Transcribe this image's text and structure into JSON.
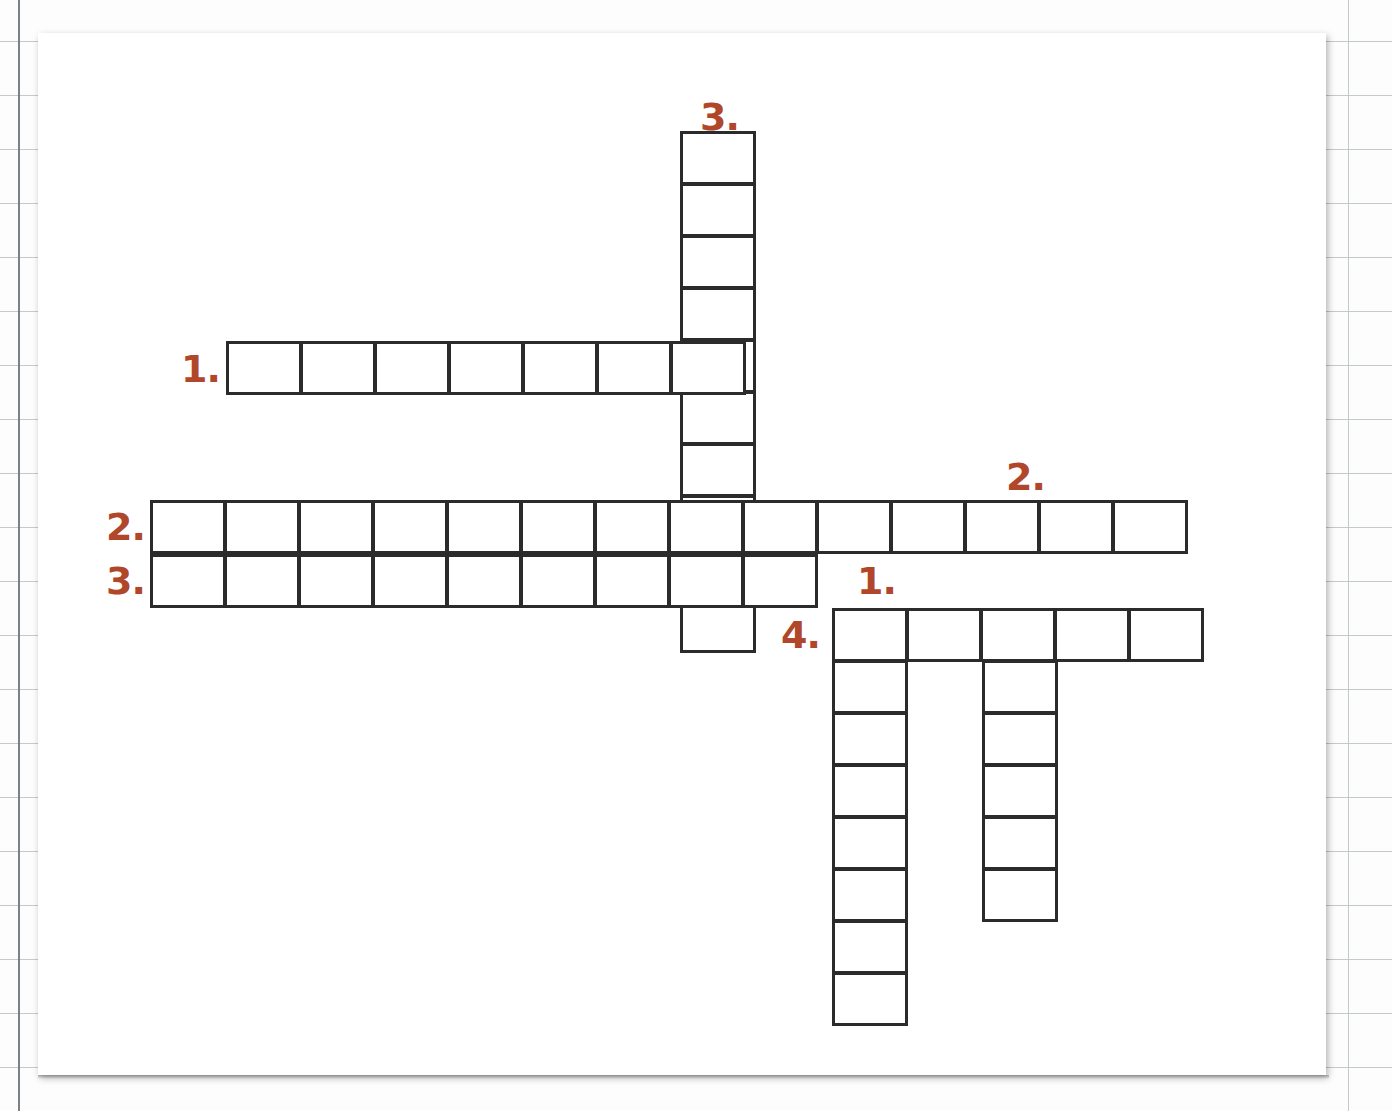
{
  "worksheet": {
    "type": "crossword-puzzle",
    "background": "ruled-graph-paper",
    "sheet_color": "#ffffff",
    "grid_line_color": "#2b2b2b",
    "clue_number_color": "#b0462a",
    "cell_width": 76,
    "cell_height": 54
  },
  "clue_numbers": [
    {
      "id": "down-3",
      "label": "3.",
      "x": 700,
      "y": 98
    },
    {
      "id": "across-1",
      "label": "1.",
      "x": 181,
      "y": 350
    },
    {
      "id": "down-2",
      "label": "2.",
      "x": 1006,
      "y": 458
    },
    {
      "id": "across-2",
      "label": "2.",
      "x": 106,
      "y": 508
    },
    {
      "id": "across-3",
      "label": "3.",
      "x": 106,
      "y": 562
    },
    {
      "id": "down-1",
      "label": "1.",
      "x": 857,
      "y": 562
    },
    {
      "id": "across-4",
      "label": "4.",
      "x": 781,
      "y": 616
    }
  ],
  "entries": [
    {
      "id": "down-3",
      "number": 3,
      "direction": "down",
      "length": 10,
      "x": 680,
      "y": 131,
      "value": ""
    },
    {
      "id": "across-1",
      "number": 1,
      "direction": "across",
      "length": 7,
      "x": 226,
      "y": 341,
      "value": ""
    },
    {
      "id": "across-2",
      "number": 2,
      "direction": "across",
      "length": 14,
      "x": 150,
      "y": 500,
      "value": ""
    },
    {
      "id": "across-3",
      "number": 3,
      "direction": "across",
      "length": 9,
      "x": 150,
      "y": 554,
      "value": ""
    },
    {
      "id": "down-2",
      "number": 2,
      "direction": "down",
      "length": 6,
      "x": 982,
      "y": 608,
      "value": ""
    },
    {
      "id": "across-4",
      "number": 4,
      "direction": "across",
      "length": 5,
      "x": 832,
      "y": 608,
      "value": ""
    },
    {
      "id": "down-1",
      "number": 1,
      "direction": "down",
      "length": 8,
      "x": 832,
      "y": 608,
      "value": ""
    }
  ],
  "paper_lines": {
    "horizontal_spacing": 54,
    "horizontal_start": 41,
    "vertical_margin_x": 18,
    "vertical_right_x": 1348
  }
}
